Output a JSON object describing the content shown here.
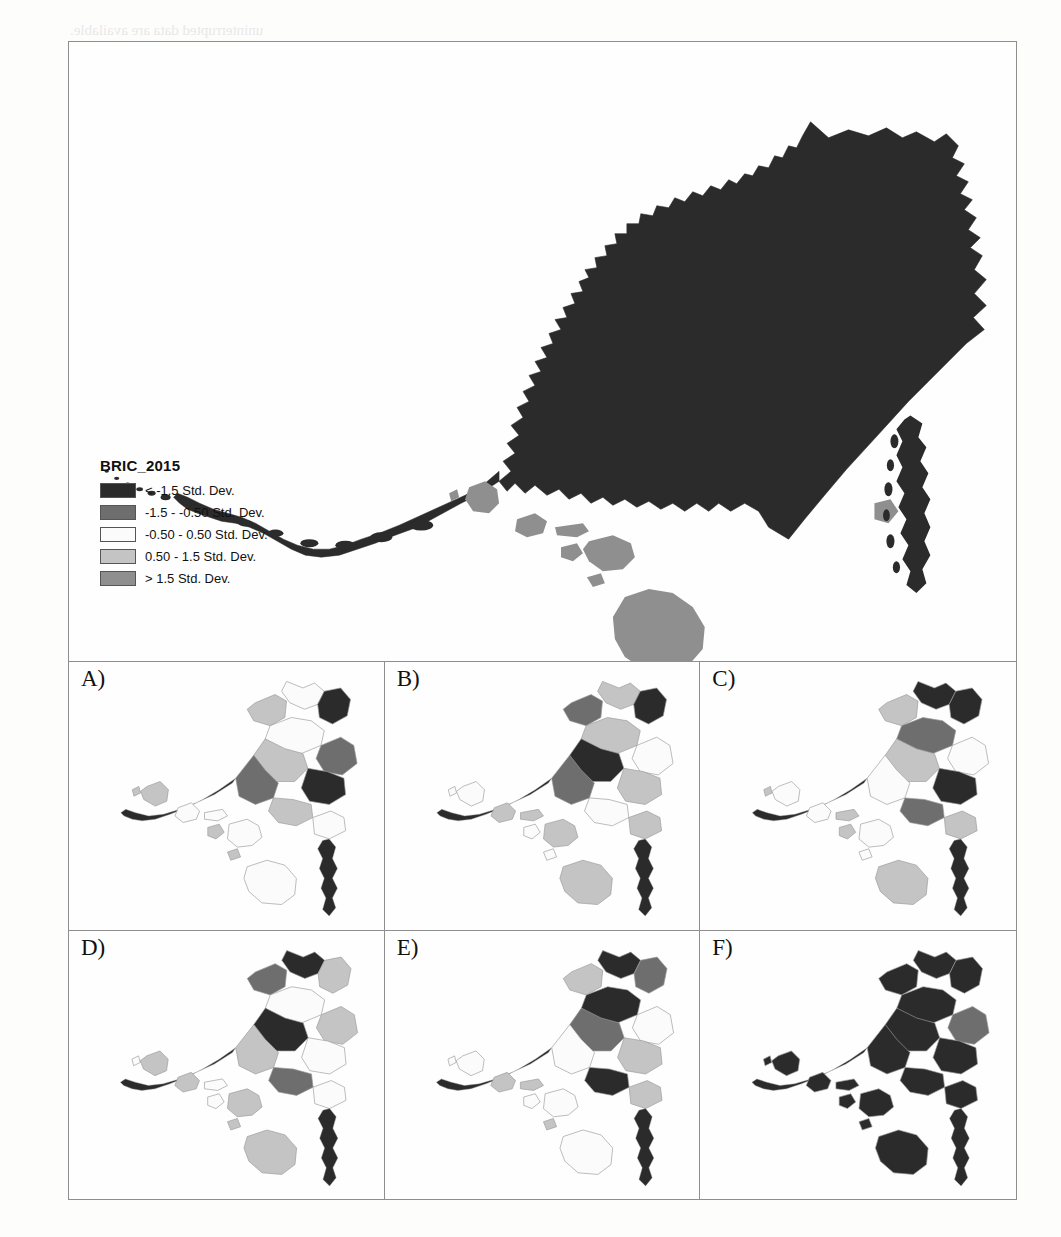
{
  "figure": {
    "legend": {
      "title": "BRIC_2015",
      "entries": [
        {
          "label": "< -1.5 Std. Dev.",
          "color": "#2b2b2b",
          "class_index": 1
        },
        {
          "label": "-1.5 - -0.50 Std. Dev.",
          "color": "#6e6e6e",
          "class_index": 2
        },
        {
          "label": "-0.50 - 0.50 Std. Dev.",
          "color": "#fbfbfb",
          "class_index": 3
        },
        {
          "label": "0.50 - 1.5 Std. Dev.",
          "color": "#c4c4c4",
          "class_index": 4
        },
        {
          "label": "> 1.5 Std. Dev.",
          "color": "#8f8f8f",
          "class_index": 5
        }
      ]
    },
    "panels": [
      {
        "id": "A",
        "label": "A)"
      },
      {
        "id": "B",
        "label": "B)"
      },
      {
        "id": "C",
        "label": "C)"
      },
      {
        "id": "D",
        "label": "D)"
      },
      {
        "id": "E",
        "label": "E)"
      },
      {
        "id": "F",
        "label": "F)"
      }
    ]
  },
  "chart_data": {
    "type": "map",
    "title": "BRIC_2015",
    "subtype": "choropleth-standard-deviation-small-multiples",
    "region": "Alaska and Hawaii (United States insets)",
    "classification": "standard deviation (5 classes)",
    "class_breaks": [
      "< -1.5",
      "-1.5 to -0.50",
      "-0.50 to 0.50",
      "0.50 to 1.5",
      "> 1.5"
    ],
    "class_colors": [
      "#2b2b2b",
      "#6e6e6e",
      "#fbfbfb",
      "#c4c4c4",
      "#8f8f8f"
    ],
    "legend_position": "lower-left of main map",
    "panel_count": 6,
    "panel_labels": [
      "A)",
      "B)",
      "C)",
      "D)",
      "E)",
      "F)"
    ],
    "main_map": {
      "name": "BRIC_2015 overview",
      "alaska_dominant_class": 1,
      "hawaii_dominant_class": 5,
      "notes": "Alaska nearly uniformly darkest class; Hawaii islands medium gray"
    },
    "small_multiples": [
      {
        "panel": "A",
        "alaska_classes": [
          1,
          2,
          3,
          4
        ],
        "hawaii_classes": [
          3,
          4
        ]
      },
      {
        "panel": "B",
        "alaska_classes": [
          1,
          2,
          3,
          4
        ],
        "hawaii_classes": [
          3,
          4
        ]
      },
      {
        "panel": "C",
        "alaska_classes": [
          1,
          2,
          3,
          4
        ],
        "hawaii_classes": [
          3,
          4
        ]
      },
      {
        "panel": "D",
        "alaska_classes": [
          1,
          2,
          3,
          4
        ],
        "hawaii_classes": [
          3,
          4
        ]
      },
      {
        "panel": "E",
        "alaska_classes": [
          1,
          2,
          3,
          4
        ],
        "hawaii_classes": [
          2,
          3,
          4
        ]
      },
      {
        "panel": "F",
        "alaska_classes": [
          1,
          2
        ],
        "hawaii_classes": [
          1
        ]
      }
    ]
  },
  "page_bleed": [
    {
      "text": "uninterrupted data are available.",
      "x": 70,
      "y": 22,
      "size": 15
    },
    {
      "text": "for the lowest aggregate units",
      "x": 70,
      "y": 45,
      "size": 15
    },
    {
      "text": "3. Outlier Assessments",
      "x": 720,
      "y": 200,
      "size": 20
    },
    {
      "text": "BRIC scores range of 1 and",
      "x": 690,
      "y": 250,
      "size": 15
    },
    {
      "text": "standard deviation",
      "x": 700,
      "y": 285,
      "size": 15
    },
    {
      "text": "above the average",
      "x": 700,
      "y": 320,
      "size": 15
    }
  ]
}
